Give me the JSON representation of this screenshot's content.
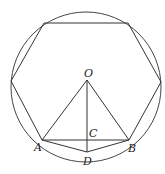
{
  "figure": {
    "labels": {
      "O": "O",
      "A": "A",
      "B": "B",
      "C": "C",
      "D": "D"
    },
    "stroke_color": "#333333",
    "background": "#ffffff"
  }
}
